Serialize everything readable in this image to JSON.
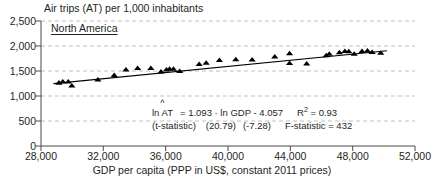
{
  "chart_data": {
    "type": "scatter",
    "title": "Air trips (AT) per 1,000 inhabitants",
    "series_label": "North America",
    "xlabel": "GDP per capita (PPP in US$, constant 2011 prices)",
    "ylabel": "",
    "xlim": [
      28000,
      52000
    ],
    "ylim": [
      0,
      2500
    ],
    "xticks": [
      "28,000",
      "32,000",
      "36,000",
      "40,000",
      "44,000",
      "48,000",
      "52,000"
    ],
    "xtick_values": [
      28000,
      32000,
      36000,
      40000,
      44000,
      48000,
      52000
    ],
    "yticks": [
      "0",
      "500",
      "1,000",
      "1,500",
      "2,000",
      "2,500"
    ],
    "ytick_values": [
      0,
      500,
      1000,
      1500,
      2000,
      2500
    ],
    "grid": "horizontal-dashed",
    "legend": "none",
    "marker": "triangle",
    "marker_color": "#000000",
    "points": [
      {
        "x": 29150,
        "y": 1268
      },
      {
        "x": 29400,
        "y": 1290
      },
      {
        "x": 29750,
        "y": 1290
      },
      {
        "x": 29980,
        "y": 1210
      },
      {
        "x": 31650,
        "y": 1330
      },
      {
        "x": 32700,
        "y": 1420
      },
      {
        "x": 33450,
        "y": 1530
      },
      {
        "x": 34200,
        "y": 1560
      },
      {
        "x": 35050,
        "y": 1560
      },
      {
        "x": 35700,
        "y": 1490
      },
      {
        "x": 36050,
        "y": 1530
      },
      {
        "x": 36250,
        "y": 1545
      },
      {
        "x": 36500,
        "y": 1545
      },
      {
        "x": 36900,
        "y": 1500
      },
      {
        "x": 38150,
        "y": 1640
      },
      {
        "x": 38600,
        "y": 1665
      },
      {
        "x": 39450,
        "y": 1720
      },
      {
        "x": 40500,
        "y": 1735
      },
      {
        "x": 41550,
        "y": 1730
      },
      {
        "x": 43000,
        "y": 1790
      },
      {
        "x": 43950,
        "y": 1855
      },
      {
        "x": 43950,
        "y": 1660
      },
      {
        "x": 45050,
        "y": 1650
      },
      {
        "x": 46300,
        "y": 1815
      },
      {
        "x": 46500,
        "y": 1845
      },
      {
        "x": 47150,
        "y": 1875
      },
      {
        "x": 47500,
        "y": 1900
      },
      {
        "x": 47750,
        "y": 1895
      },
      {
        "x": 48100,
        "y": 1845
      },
      {
        "x": 48600,
        "y": 1900
      },
      {
        "x": 48950,
        "y": 1910
      },
      {
        "x": 49250,
        "y": 1880
      },
      {
        "x": 49800,
        "y": 1865
      }
    ],
    "trendline": {
      "x_start": 28800,
      "y_start": 1248,
      "x_end": 50200,
      "y_end": 1905
    },
    "annotation": {
      "equation_lhs": "ln AT",
      "equation_hat": "^",
      "equation_rhs": "= 1.093 · ln GDP - 4.057",
      "tstat_label": "(t-statistic)",
      "tstat_slope": "(20.79)",
      "tstat_intercept": "(-7.28)",
      "r_squared_label": "R",
      "r_squared_sup": "2",
      "r_squared_value": "= 0.93",
      "f_statistic": "F-statistic = 432"
    }
  }
}
